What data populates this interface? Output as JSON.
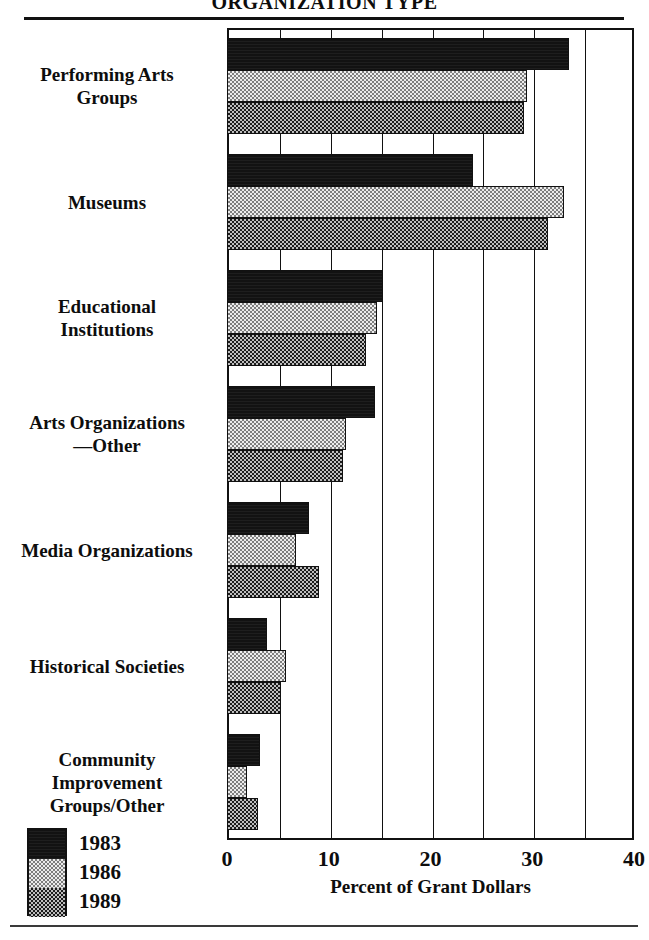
{
  "chart_data": {
    "type": "bar",
    "orientation": "horizontal",
    "title": "ORGANIZATION TYPE",
    "xlabel": "Percent of Grant Dollars",
    "ylabel": "",
    "xlim": [
      0,
      40
    ],
    "xticks": [
      0,
      10,
      20,
      30,
      40
    ],
    "xtick_labels": [
      "0",
      "10",
      "20",
      "30",
      "40"
    ],
    "gridlines_every": 5,
    "grid": true,
    "legend_position": "bottom-left",
    "categories": [
      "Performing Arts Groups",
      "Museums",
      "Educational Institutions",
      "Arts Organizations—Other",
      "Media Organizations",
      "Historical Societies",
      "Community Improvement Groups/Other"
    ],
    "category_label_lines": [
      [
        "Performing Arts",
        "Groups"
      ],
      [
        "Museums"
      ],
      [
        "Educational",
        "Institutions"
      ],
      [
        "Arts Organizations",
        "—Other"
      ],
      [
        "Media Organizations"
      ],
      [
        "Historical Societies"
      ],
      [
        "Community",
        "Improvement",
        "Groups/Other"
      ]
    ],
    "series": [
      {
        "name": "1983",
        "values": [
          33.6,
          24.2,
          15.3,
          14.5,
          8.1,
          3.9,
          3.2
        ]
      },
      {
        "name": "1986",
        "values": [
          29.5,
          33.1,
          14.7,
          11.7,
          6.8,
          5.8,
          2.0
        ]
      },
      {
        "name": "1989",
        "values": [
          29.2,
          31.5,
          13.7,
          11.4,
          9.0,
          5.3,
          3.0
        ]
      }
    ]
  },
  "legend": {
    "entries": [
      {
        "label": "1983",
        "pattern": "solid-black",
        "color": "#121212"
      },
      {
        "label": "1986",
        "pattern": "light-checker",
        "color": "#e8e8e8"
      },
      {
        "label": "1989",
        "pattern": "dark-checker",
        "color": "#6a6a6a"
      }
    ]
  },
  "colors": {
    "ink": "#111111",
    "background": "#ffffff",
    "series_1983": "#121212",
    "series_1986": "#e8e8e8",
    "series_1989": "#6a6a6a"
  }
}
